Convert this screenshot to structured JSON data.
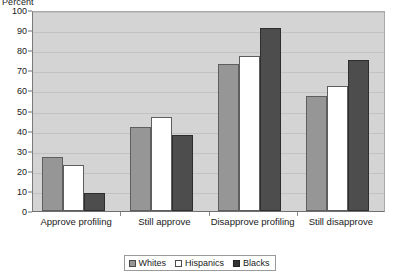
{
  "chart_data": {
    "type": "bar",
    "title": "",
    "ylabel": "Percent",
    "xlabel": "",
    "ylim": [
      0,
      100
    ],
    "ytick_step": 10,
    "yticks": [
      0,
      10,
      20,
      30,
      40,
      50,
      60,
      70,
      80,
      90,
      100
    ],
    "grid": true,
    "legend_position": "bottom",
    "categories": [
      "Approve profiling",
      "Still approve",
      "Disapprove profiling",
      "Still disapprove"
    ],
    "series": [
      {
        "name": "Whites",
        "color": "#969696",
        "values": [
          27,
          42,
          73,
          57
        ]
      },
      {
        "name": "Hispanics",
        "color": "#ffffff",
        "values": [
          23,
          47,
          77,
          62
        ]
      },
      {
        "name": "Blacks",
        "color": "#4d4d4d",
        "values": [
          9,
          38,
          91,
          75
        ]
      }
    ]
  },
  "legend": {
    "items": [
      {
        "label": "Whites"
      },
      {
        "label": "Hispanics"
      },
      {
        "label": "Blacks"
      }
    ]
  }
}
